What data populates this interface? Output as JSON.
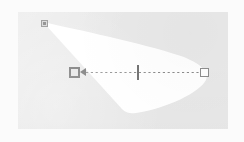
{
  "app": {
    "title": "Light Cone Editor",
    "viewport_label": "viewport"
  },
  "canvas": {
    "background_color": "#e9e9e9",
    "page_color": "#fbfbfb",
    "width": 210,
    "height": 117
  },
  "beam": {
    "name": "light-cone",
    "fill_color": "#ffffff",
    "label": ""
  },
  "guide": {
    "name": "direction-guide",
    "style": "dashed",
    "color": "#8c8c8c",
    "label": ""
  },
  "handles": {
    "source": {
      "name": "source-node-handle",
      "label": "",
      "color": "#9a9a9a",
      "x": 41,
      "y": 20
    },
    "origin": {
      "name": "origin-direction-handle",
      "label": "",
      "color": "#6f6f6f",
      "x": 69,
      "y": 72
    },
    "target": {
      "name": "target-point-handle",
      "label": "",
      "color": "#8e8e8e",
      "x": 205,
      "y": 72
    },
    "midpoint": {
      "name": "midpoint-tick",
      "label": "",
      "color": "#6c6c6c",
      "x": 137,
      "y": 72
    }
  }
}
